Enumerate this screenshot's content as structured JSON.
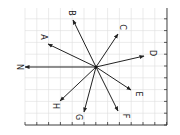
{
  "diagram": {
    "type": "vector-rose",
    "origin": [
      96,
      67
    ],
    "grid": {
      "x0": 25,
      "y0": 8,
      "x1": 167,
      "y1": 125,
      "step": 11.8,
      "color": "#dddddd"
    },
    "axis_color": "#333333",
    "vector_color": "#222222",
    "vectors": [
      {
        "label": "N",
        "tip": [
          25,
          67
        ],
        "label_pos": [
          19,
          67
        ]
      },
      {
        "label": "A",
        "tip": [
          48,
          44
        ],
        "label_pos": [
          43,
          37
        ]
      },
      {
        "label": "B",
        "tip": [
          73,
          20
        ],
        "label_pos": [
          71,
          13
        ]
      },
      {
        "label": "C",
        "tip": [
          118,
          34
        ],
        "label_pos": [
          122,
          27
        ]
      },
      {
        "label": "D",
        "tip": [
          144,
          56
        ],
        "label_pos": [
          152,
          53
        ]
      },
      {
        "label": "E",
        "tip": [
          131,
          90
        ],
        "label_pos": [
          138,
          94
        ]
      },
      {
        "label": "F",
        "tip": [
          118,
          111
        ],
        "label_pos": [
          125,
          116
        ]
      },
      {
        "label": "G",
        "tip": [
          84,
          112
        ],
        "label_pos": [
          78,
          117
        ]
      },
      {
        "label": "H",
        "tip": [
          60,
          101
        ],
        "label_pos": [
          55,
          106
        ]
      }
    ]
  }
}
